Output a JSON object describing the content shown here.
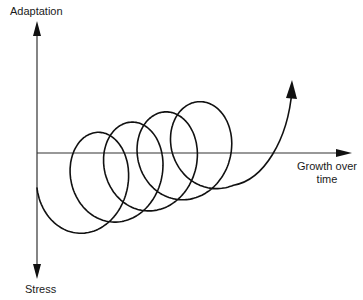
{
  "diagram": {
    "title": "",
    "y_axis": {
      "positive_label": "Adaptation",
      "negative_label": "Stress"
    },
    "x_axis": {
      "label_line1": "Growth over",
      "label_line2": "time"
    },
    "spiral": {
      "loops": 5,
      "description": "Upward-trending spiral of loops along the growth axis, ending in an arrow pointing up-right",
      "stroke_color": "#111111"
    },
    "colors": {
      "axis": "#333333",
      "curve": "#111111",
      "background": "#ffffff"
    }
  }
}
